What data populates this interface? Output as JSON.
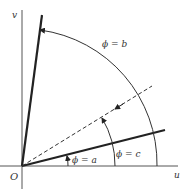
{
  "diagram": {
    "axes": {
      "horizontal_label": "u",
      "vertical_label": "v",
      "origin_label": "O"
    },
    "labels": {
      "phi_a": "ϕ = a",
      "phi_b": "ϕ = b",
      "phi_c": "ϕ = c"
    },
    "lines": [
      {
        "name": "ray-phi-b",
        "style": "thick",
        "angle_desc": "near vertical"
      },
      {
        "name": "ray-phi-c",
        "style": "thick",
        "angle_desc": "shallow"
      },
      {
        "name": "ray-dashed",
        "style": "dashed",
        "angle_desc": "diagonal"
      }
    ],
    "colors": {
      "stroke": "#222222",
      "axis": "#555555",
      "background": "#ffffff"
    }
  }
}
